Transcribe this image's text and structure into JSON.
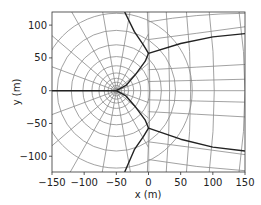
{
  "chart_data": {
    "type": "line",
    "title": "",
    "xlabel": "x (m)",
    "ylabel": "y (m)",
    "xlim": [
      -150,
      150
    ],
    "ylim": [
      -124,
      120
    ],
    "xticks": [
      -150,
      -100,
      -50,
      0,
      50,
      100,
      150
    ],
    "yticks": [
      -100,
      -50,
      0,
      50,
      100
    ],
    "xtick_labels": [
      "−150",
      "−100",
      "−50",
      "0",
      "50",
      "100",
      "150"
    ],
    "ytick_labels": [
      "−100",
      "−50",
      "0",
      "50",
      "100"
    ],
    "grid": false,
    "legend": null,
    "source_point": [
      -50,
      0
    ],
    "series": [
      {
        "name": "dividing-streamline-upper",
        "color": "#222222",
        "points": [
          [
            -37,
            120
          ],
          [
            -22,
            90
          ],
          [
            -8,
            70
          ],
          [
            0,
            57
          ],
          [
            50,
            72
          ],
          [
            100,
            82
          ],
          [
            150,
            87
          ]
        ]
      },
      {
        "name": "dividing-streamline-lower",
        "color": "#222222",
        "points": [
          [
            -37,
            -124
          ],
          [
            -22,
            -90
          ],
          [
            -8,
            -70
          ],
          [
            0,
            -57
          ],
          [
            50,
            -74
          ],
          [
            100,
            -86
          ],
          [
            150,
            -92
          ]
        ]
      },
      {
        "name": "inner-boundary-upper",
        "color": "#222222",
        "points": [
          [
            -50,
            0
          ],
          [
            -35,
            8
          ],
          [
            -20,
            25
          ],
          [
            -5,
            45
          ],
          [
            0,
            57
          ]
        ]
      },
      {
        "name": "inner-boundary-lower",
        "color": "#222222",
        "points": [
          [
            -50,
            0
          ],
          [
            -35,
            -8
          ],
          [
            -20,
            -25
          ],
          [
            -5,
            -45
          ],
          [
            0,
            -57
          ]
        ]
      },
      {
        "name": "stagnation-line",
        "color": "#222222",
        "points": [
          [
            -150,
            0
          ],
          [
            -50,
            0
          ]
        ]
      }
    ],
    "circle_radii": [
      4,
      8,
      13,
      19,
      27,
      38,
      52,
      70,
      92,
      118
    ],
    "radial_angles_deg": [
      0,
      20,
      40,
      60,
      80,
      100,
      120,
      140,
      160,
      180,
      200,
      220,
      240,
      260,
      280,
      300,
      320,
      340
    ],
    "right_verticals_x": [
      0,
      30,
      62,
      98,
      145
    ],
    "right_horizontals_y": [
      -105,
      -78,
      -32,
      -14,
      0,
      14,
      32,
      78,
      105
    ]
  },
  "colors": {
    "grid_line": "#8a8a8a",
    "dark_line": "#222222",
    "axis": "#333333",
    "faint_vertical": "#dcdcdc"
  }
}
